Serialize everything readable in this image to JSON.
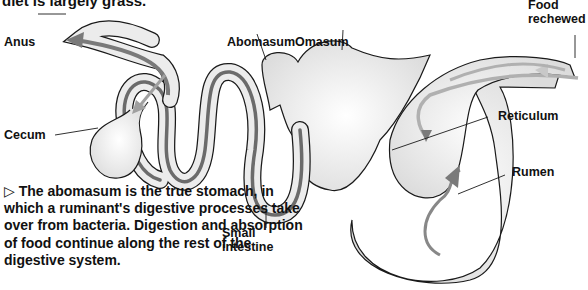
{
  "intro_text": "diet is largely grass.",
  "labels": {
    "anus": "Anus",
    "abomasum": "Abomasum",
    "omasum": "Omasum",
    "food_rechewed_line1": "Food",
    "food_rechewed_line2": "rechewed",
    "cecum": "Cecum",
    "reticulum": "Reticulum",
    "rumen": "Rumen",
    "small_intestine_line1": "Small",
    "small_intestine_line2": "intestine"
  },
  "caption": {
    "marker": "▷",
    "text": "The abomasum is the true stomach, in which a ruminant's digestive processes take over from bacteria. Digestion and absorption of food continue along the rest of the digestive system."
  },
  "colors": {
    "outline": "#1a1a1a",
    "gut_fill": "#e6e6e6",
    "flow_dark": "#6b6b6b",
    "flow_light": "#b5b5b5"
  }
}
